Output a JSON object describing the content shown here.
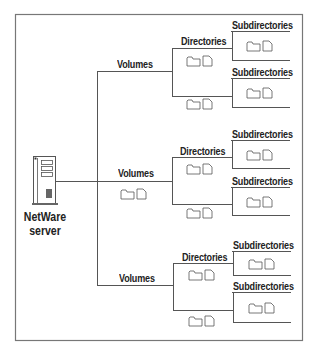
{
  "diagram": {
    "server": {
      "line1": "NetWare",
      "line2": "server",
      "icon": "server-tower-icon"
    },
    "labels": {
      "volumes": "Volumes",
      "directories": "Directories",
      "subdirectories": "Subdirectories"
    },
    "branches": [
      {
        "volume": "Volumes",
        "directories": "Directories",
        "subdirectories": [
          "Subdirectories",
          "Subdirectories"
        ]
      },
      {
        "volume": "Volumes",
        "directories": "Directories",
        "subdirectories": [
          "Subdirectories",
          "Subdirectories"
        ]
      },
      {
        "volume": "Volumes",
        "directories": "Directories",
        "subdirectories": [
          "Subdirectories",
          "Subdirectories"
        ]
      }
    ],
    "icons": [
      "folder-icon",
      "file-icon"
    ],
    "colors": {
      "line": "#555555",
      "text": "#222222",
      "background": "#ffffff"
    }
  }
}
